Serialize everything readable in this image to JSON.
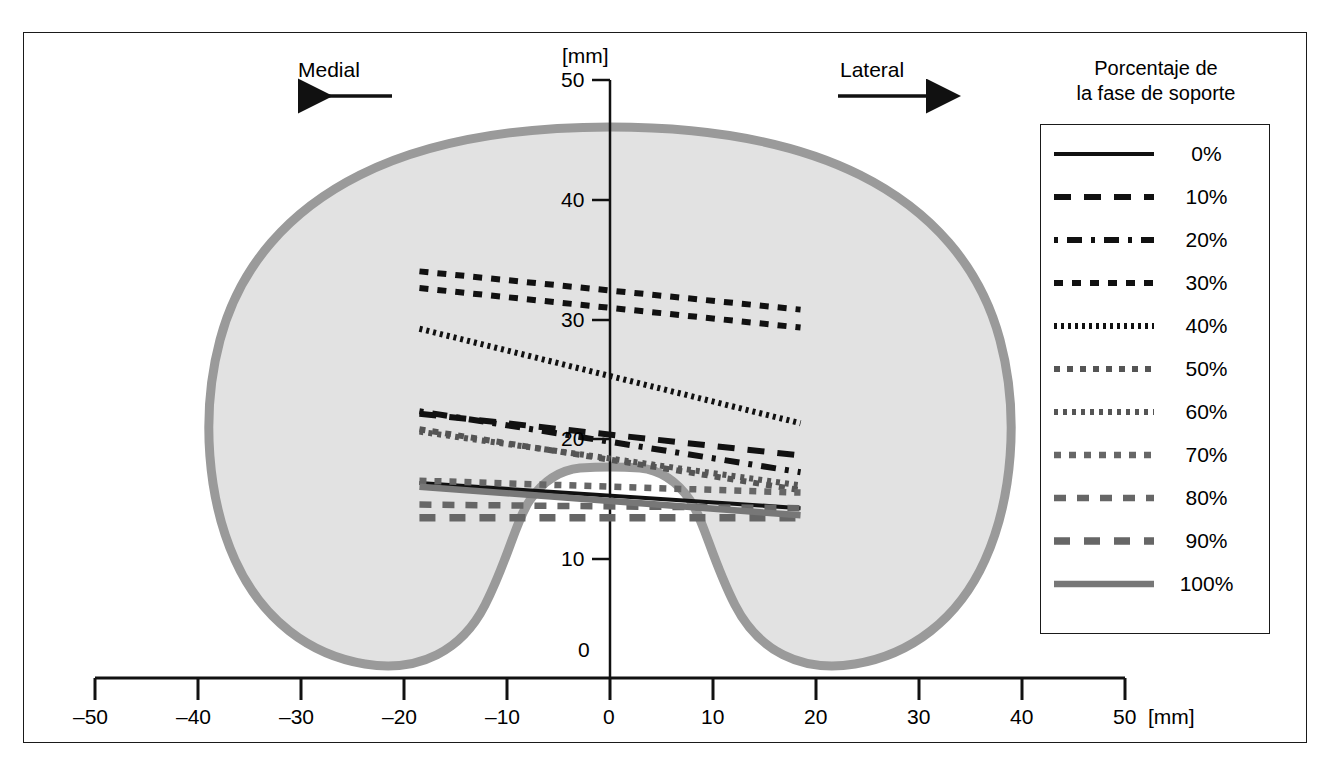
{
  "figure": {
    "direction_left": "Medial",
    "direction_right": "Lateral",
    "y_axis_unit": "[mm]",
    "x_axis_unit": "[mm]"
  },
  "legend": {
    "title_line1": "Porcentaje de",
    "title_line2": "la fase de soporte",
    "entries": [
      {
        "label": "0%",
        "style": "solid",
        "color": "#111111",
        "width": 4.0,
        "dash": ""
      },
      {
        "label": "10%",
        "style": "dashed",
        "color": "#111111",
        "width": 6.0,
        "dash": "17,13"
      },
      {
        "label": "20%",
        "style": "dash-dot",
        "color": "#111111",
        "width": 6.0,
        "dash": "4,9,15,9"
      },
      {
        "label": "30%",
        "style": "dotted-square",
        "color": "#111111",
        "width": 6.0,
        "dash": "9,9"
      },
      {
        "label": "40%",
        "style": "fine-dotted",
        "color": "#111111",
        "width": 6.0,
        "dash": "3,4"
      },
      {
        "label": "50%",
        "style": "dotted",
        "color": "#555555",
        "width": 6.0,
        "dash": "6,7"
      },
      {
        "label": "60%",
        "style": "fine-dotted",
        "color": "#555555",
        "width": 6.0,
        "dash": "4,5"
      },
      {
        "label": "70%",
        "style": "dotted",
        "color": "#666666",
        "width": 6.5,
        "dash": "7,8"
      },
      {
        "label": "80%",
        "style": "dashed",
        "color": "#666666",
        "width": 6.5,
        "dash": "12,11"
      },
      {
        "label": "90%",
        "style": "dashed",
        "color": "#666666",
        "width": 7.5,
        "dash": "16,14"
      },
      {
        "label": "100%",
        "style": "solid",
        "color": "#777777",
        "width": 6.5,
        "dash": ""
      }
    ]
  },
  "chart_data": {
    "type": "line",
    "title": "",
    "xlabel": "[mm]",
    "ylabel": "[mm]",
    "xlim": [
      -50,
      50
    ],
    "ylim": [
      0,
      50
    ],
    "xticks": [
      -50,
      -40,
      -30,
      -20,
      -10,
      0,
      10,
      20,
      30,
      40,
      50
    ],
    "xtick_labels": [
      "–50",
      "–40",
      "–30",
      "–20",
      "–10",
      "0",
      "10",
      "20",
      "30",
      "40",
      "50"
    ],
    "yticks": [
      0,
      10,
      20,
      30,
      40,
      50
    ],
    "ytick_labels": [
      "0",
      "10",
      "20",
      "30",
      "40",
      "50"
    ],
    "grid": false,
    "legend_position": "right-outside",
    "annotations": [
      "Medial (arrow left)",
      "Lateral (arrow right)"
    ],
    "background_shape": "tibial plateau outline (gray filled silhouette)",
    "series": [
      {
        "name": "0%",
        "x": [
          -18.5,
          18.5
        ],
        "y": [
          16.3,
          14.2
        ]
      },
      {
        "name": "10%",
        "x": [
          -18.5,
          18.5
        ],
        "y": [
          22.1,
          18.6
        ]
      },
      {
        "name": "20%",
        "x": [
          -18.5,
          18.5
        ],
        "y": [
          22.3,
          17.2
        ]
      },
      {
        "name": "30%",
        "x": [
          -18.5,
          18.5
        ],
        "y": [
          32.6,
          29.3
        ]
      },
      {
        "name": "40%",
        "x": [
          -18.5,
          18.5
        ],
        "y": [
          29.2,
          21.3
        ]
      },
      {
        "name": "50%",
        "x": [
          -18.5,
          18.5
        ],
        "y": [
          20.8,
          15.7
        ]
      },
      {
        "name": "60%",
        "x": [
          -18.5,
          18.5
        ],
        "y": [
          20.6,
          16.1
        ]
      },
      {
        "name": "70%",
        "x": [
          -18.5,
          18.5
        ],
        "y": [
          16.5,
          15.5
        ]
      },
      {
        "name": "80%",
        "x": [
          -18.5,
          18.5
        ],
        "y": [
          14.5,
          14.2
        ]
      },
      {
        "name": "90%",
        "x": [
          -18.5,
          18.5
        ],
        "y": [
          13.4,
          13.4
        ]
      },
      {
        "name": "100%",
        "x": [
          -18.5,
          18.5
        ],
        "y": [
          16.0,
          13.6
        ]
      },
      {
        "name": "30%-upper",
        "x": [
          -18.5,
          18.5
        ],
        "y": [
          34.0,
          30.8
        ]
      }
    ]
  },
  "colors": {
    "shape_fill": "#e2e2e2",
    "shape_stroke": "#9a9a9a",
    "axis": "#111111",
    "frame": "#1a1a1a"
  }
}
